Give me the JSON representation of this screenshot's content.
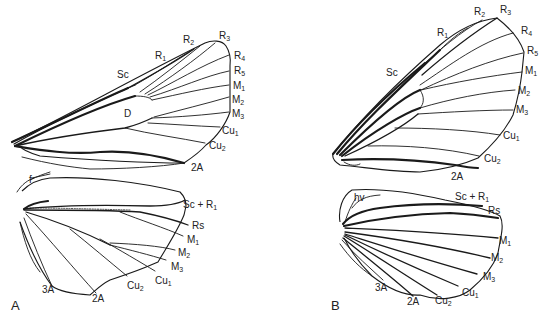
{
  "figure": {
    "panels": [
      {
        "letter": "A",
        "forewing": {
          "labels": {
            "Sc": "Sc",
            "R1": "R",
            "R1_sub": "1",
            "R2": "R",
            "R2_sub": "2",
            "R3": "R",
            "R3_sub": "3",
            "R4": "R",
            "R4_sub": "4",
            "R5": "R",
            "R5_sub": "5",
            "M1": "M",
            "M1_sub": "1",
            "M2": "M",
            "M2_sub": "2",
            "M3": "M",
            "M3_sub": "3",
            "Cu1": "Cu",
            "Cu1_sub": "1",
            "Cu2": "Cu",
            "Cu2_sub": "2",
            "A2": "2A",
            "D": "D"
          }
        },
        "hindwing": {
          "labels": {
            "f": "f",
            "ScR1": "Sc + R",
            "ScR1_sub": "1",
            "Rs": "Rs",
            "M1": "M",
            "M1_sub": "1",
            "M2": "M",
            "M2_sub": "2",
            "M3": "M",
            "M3_sub": "3",
            "Cu1": "Cu",
            "Cu1_sub": "1",
            "Cu2": "Cu",
            "Cu2_sub": "2",
            "A2": "2A",
            "A3": "3A"
          }
        }
      },
      {
        "letter": "B",
        "forewing": {
          "labels": {
            "Sc": "Sc",
            "R1": "R",
            "R1_sub": "1",
            "R2": "R",
            "R2_sub": "2",
            "R3": "R",
            "R3_sub": "3",
            "R4": "R",
            "R4_sub": "4",
            "R5": "R",
            "R5_sub": "5",
            "M1": "M",
            "M1_sub": "1",
            "M2": "M",
            "M2_sub": "2",
            "M3": "M",
            "M3_sub": "3",
            "Cu1": "Cu",
            "Cu1_sub": "1",
            "Cu2": "Cu",
            "Cu2_sub": "2",
            "A2": "2A"
          }
        },
        "hindwing": {
          "labels": {
            "hv": "hv",
            "ScR1": "Sc + R",
            "ScR1_sub": "1",
            "Rs": "Rs",
            "M1": "M",
            "M1_sub": "1",
            "M2": "M",
            "M2_sub": "2",
            "M3": "M",
            "M3_sub": "3",
            "Cu1": "Cu",
            "Cu1_sub": "1",
            "Cu2": "Cu",
            "Cu2_sub": "2",
            "A2": "2A",
            "A3": "3A"
          }
        }
      }
    ]
  }
}
